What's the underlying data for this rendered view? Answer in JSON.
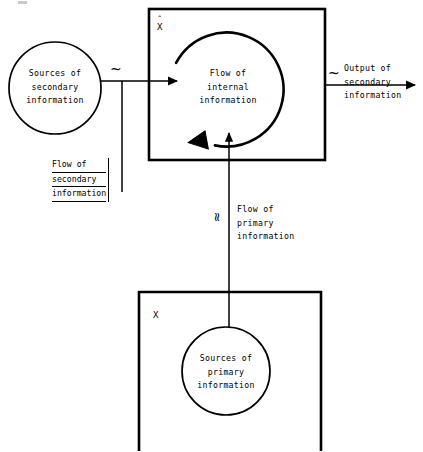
{
  "diagram": {
    "type": "flow-diagram",
    "background_color": "#ffffff",
    "stroke_color": "#000000",
    "nodes": {
      "secondary_sources_circle": {
        "label_lines": [
          "Sources of",
          "secondary",
          "information"
        ],
        "shape": "circle"
      },
      "internal_flow_box": {
        "variable_label": "X",
        "variable_accent": "ˆ",
        "label_lines": [
          "Flow of",
          "internal",
          "information"
        ],
        "shape": "rectangle"
      },
      "primary_sources_box": {
        "variable_label": "X",
        "shape": "rectangle"
      },
      "primary_sources_circle": {
        "label_lines": [
          "Sources of",
          "primary",
          "information"
        ],
        "shape": "circle"
      }
    },
    "edges": {
      "secondary_input": {
        "label_lines": [
          "Flow of",
          "secondary",
          "information"
        ],
        "marker": "~",
        "underlined": true,
        "direction": "left-to-right"
      },
      "secondary_output": {
        "label_lines": [
          "Output of",
          "secondary",
          "information"
        ],
        "marker": "~",
        "underlined": false,
        "direction": "left-to-right"
      },
      "primary_input": {
        "label_lines": [
          "Flow of",
          "primary",
          "information"
        ],
        "marker": "≈",
        "underlined": false,
        "direction": "bottom-to-top"
      },
      "internal_loop": {
        "label": "circular internal flow",
        "direction": "counterclockwise"
      }
    }
  }
}
